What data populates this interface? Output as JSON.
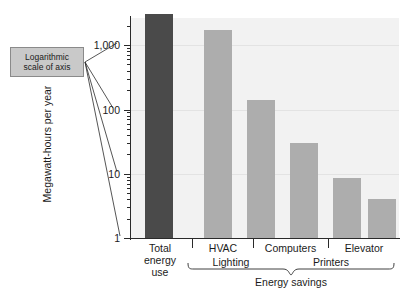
{
  "callout": {
    "line1": "Logarithmic",
    "line2": "scale of axis"
  },
  "axis": {
    "ylabel": "Megawatt-hours per year",
    "yticks": [
      "1,000",
      "100",
      "10",
      "1"
    ]
  },
  "group_brace": {
    "label": "Energy savings"
  },
  "xlabels": {
    "total_line1": "Total",
    "total_line2": "energy",
    "total_line3": "use",
    "hvac": "HVAC",
    "lighting": "Lighting",
    "computers": "Computers",
    "printers": "Printers",
    "elevator": "Elevator"
  },
  "colors": {
    "total_bar": "#4a4a4a",
    "savings_bar": "#adadad",
    "plot_background": "#f2f2f2",
    "callout_fill": "#c9c9c9",
    "axis": "#2a2a2a"
  },
  "chart_data": {
    "type": "bar",
    "title": "",
    "xlabel": "",
    "ylabel": "Megawatt-hours per year",
    "scale": "log",
    "ylim": [
      1,
      4000
    ],
    "ytick_values": [
      1,
      10,
      100,
      1000
    ],
    "ytick_labels": [
      "1",
      "10",
      "100",
      "1,000"
    ],
    "grid": true,
    "legend": false,
    "categories": [
      "Total energy use",
      "HVAC",
      "Lighting",
      "Computers",
      "Printers",
      "Elevator"
    ],
    "values": [
      3000,
      1700,
      140,
      30,
      8.5,
      4
    ],
    "bar_colors": [
      "#4a4a4a",
      "#adadad",
      "#adadad",
      "#adadad",
      "#adadad",
      "#adadad"
    ],
    "annotations": [
      {
        "text": "Logarithmic scale of axis",
        "type": "callout",
        "points_to": "y-axis decade ticks"
      },
      {
        "text": "Energy savings",
        "type": "brace",
        "covers": [
          "HVAC",
          "Lighting",
          "Computers",
          "Printers",
          "Elevator"
        ]
      }
    ]
  }
}
